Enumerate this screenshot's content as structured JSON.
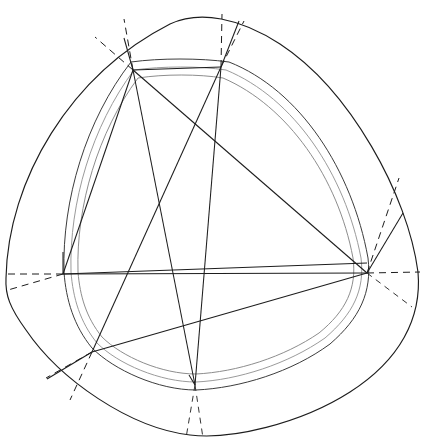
{
  "figure": {
    "title": "Inscribed hexagon in a rounded triangular (Reuleaux-like) curve",
    "canvas": {
      "width": 432,
      "height": 446,
      "background": "#ffffff"
    },
    "colors": {
      "outline": "#1d1d1d",
      "chord": "#1d1d1d",
      "inner_ring": "#9b9b9b",
      "inner_ring_dark": "#3c3c3c",
      "dashed": "#1d1d1d",
      "background": "#ffffff"
    },
    "vertices": [
      {
        "id": "A",
        "label": "top-left-vertex",
        "x": 133,
        "y": 70
      },
      {
        "id": "B",
        "label": "top-right-vertex",
        "x": 221,
        "y": 67
      },
      {
        "id": "C",
        "label": "right-vertex",
        "x": 367,
        "y": 273
      },
      {
        "id": "D",
        "label": "bottom-right-vertex",
        "x": 195,
        "y": 385
      },
      {
        "id": "E",
        "label": "bottom-left-vertex",
        "x": 92,
        "y": 352
      },
      {
        "id": "F",
        "label": "left-vertex",
        "x": 63,
        "y": 274
      }
    ],
    "chords": [
      {
        "from": "A",
        "to": "C"
      },
      {
        "from": "A",
        "to": "D"
      },
      {
        "from": "B",
        "to": "E"
      },
      {
        "from": "B",
        "to": "D"
      },
      {
        "from": "F",
        "to": "C"
      },
      {
        "from": "E",
        "to": "C"
      },
      {
        "from": "A",
        "to": "F"
      },
      {
        "from": "B",
        "to": "A"
      }
    ],
    "outer_curve": {
      "type": "rounded-triangle",
      "extremes": {
        "top": {
          "x": 186,
          "y": 11
        },
        "right": {
          "x": 418,
          "y": 272
        },
        "bottom": {
          "x": 190,
          "y": 435
        },
        "left": {
          "x": 6,
          "y": 278
        }
      }
    },
    "inner_ring": {
      "type": "double-walled-rounded-triangle",
      "wall_gap_px": 6
    },
    "dashed_rays": [
      {
        "from": "A",
        "label": "ray-A-out-1"
      },
      {
        "from": "A",
        "label": "ray-A-out-2"
      },
      {
        "from": "B",
        "label": "ray-B-out-1"
      },
      {
        "from": "B",
        "label": "ray-B-out-2"
      },
      {
        "from": "C",
        "label": "ray-C-out-1"
      },
      {
        "from": "C",
        "label": "ray-C-out-2"
      },
      {
        "from": "D",
        "label": "ray-D-out-1"
      },
      {
        "from": "D",
        "label": "ray-D-out-2"
      },
      {
        "from": "E",
        "label": "ray-E-out-1"
      },
      {
        "from": "E",
        "label": "ray-E-out-2"
      },
      {
        "from": "F",
        "label": "ray-F-out-1"
      },
      {
        "from": "F",
        "label": "ray-F-out-2"
      }
    ],
    "radial_solid_lines": [
      {
        "from": "A",
        "label": "spoke-A"
      },
      {
        "from": "B",
        "label": "spoke-B"
      },
      {
        "from": "C",
        "label": "spoke-C"
      },
      {
        "from": "D",
        "label": "spoke-D"
      },
      {
        "from": "E",
        "label": "spoke-E"
      },
      {
        "from": "F",
        "label": "spoke-F"
      }
    ]
  }
}
